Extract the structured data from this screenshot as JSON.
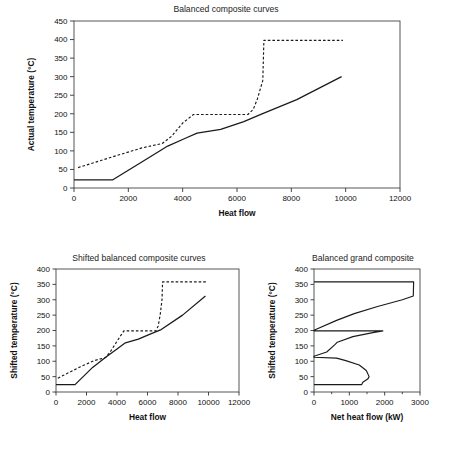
{
  "figure": {
    "name": "pinch-analysis-composite-curves-figure",
    "panels": [
      "balanced-composite-curves",
      "shifted-balanced-composite-curves",
      "balanced-grand-composite"
    ]
  },
  "colors": {
    "ink": "#1a1a1a",
    "frame": "#444444",
    "background": "#ffffff"
  },
  "chart_data": [
    {
      "id": "balanced-composite-curves",
      "type": "line",
      "title": "Balanced composite curves",
      "xlabel": "Heat flow",
      "ylabel": "Actual temperature (°C)",
      "xlim": [
        0,
        12000
      ],
      "ylim": [
        0,
        450
      ],
      "xticks": [
        0,
        2000,
        4000,
        6000,
        8000,
        10000,
        12000
      ],
      "xticklabels": [
        "0",
        "2000",
        "4000",
        "6000",
        "8000",
        "10000",
        "12000"
      ],
      "yticks": [
        0,
        50,
        100,
        150,
        200,
        250,
        300,
        350,
        400,
        450
      ],
      "yticklabels": [
        "0",
        "50",
        "100",
        "150",
        "200",
        "250",
        "300",
        "350",
        "400",
        "450"
      ],
      "grid": false,
      "legend": "none",
      "series": [
        {
          "name": "Cold composite curve",
          "style": "solid",
          "points": [
            [
              0,
              22
            ],
            [
              1430,
              22
            ],
            [
              2600,
              75
            ],
            [
              3450,
              113
            ],
            [
              4100,
              134
            ],
            [
              4530,
              148
            ],
            [
              5400,
              158
            ],
            [
              6250,
              179
            ],
            [
              6900,
              199
            ],
            [
              8200,
              238
            ],
            [
              9850,
              300
            ]
          ]
        },
        {
          "name": "Hot composite curve",
          "style": "dashed",
          "points": [
            [
              150,
              55
            ],
            [
              1600,
              88
            ],
            [
              2500,
              108
            ],
            [
              3250,
              120
            ],
            [
              3600,
              140
            ],
            [
              4000,
              175
            ],
            [
              4400,
              198
            ],
            [
              6400,
              198
            ],
            [
              6600,
              212
            ],
            [
              6750,
              240
            ],
            [
              6950,
              290
            ],
            [
              6990,
              398
            ],
            [
              9900,
              398
            ]
          ]
        }
      ]
    },
    {
      "id": "shifted-balanced-composite-curves",
      "type": "line",
      "title": "Shifted balanced composite curves",
      "xlabel": "Heat flow",
      "ylabel": "Shifted temperature (°C)",
      "xlim": [
        0,
        12000
      ],
      "ylim": [
        0,
        400
      ],
      "xticks": [
        0,
        2000,
        4000,
        6000,
        8000,
        10000,
        12000
      ],
      "xticklabels": [
        "0",
        "2000",
        "4000",
        "6000",
        "8000",
        "10000",
        "12000"
      ],
      "yticks": [
        0,
        50,
        100,
        150,
        200,
        250,
        300,
        350,
        400
      ],
      "yticklabels": [
        "0",
        "50",
        "100",
        "150",
        "200",
        "250",
        "300",
        "350",
        "400"
      ],
      "grid": false,
      "legend": "none",
      "series": [
        {
          "name": "Shifted cold composite curve",
          "style": "solid",
          "points": [
            [
              0,
              24
            ],
            [
              1250,
              24
            ],
            [
              2400,
              80
            ],
            [
              3300,
              115
            ],
            [
              4000,
              140
            ],
            [
              4550,
              160
            ],
            [
              5400,
              172
            ],
            [
              6250,
              190
            ],
            [
              6900,
              203
            ],
            [
              8300,
              250
            ],
            [
              9800,
              312
            ]
          ]
        },
        {
          "name": "Shifted hot composite curve",
          "style": "dashed",
          "points": [
            [
              120,
              45
            ],
            [
              1600,
              82
            ],
            [
              2500,
              102
            ],
            [
              3250,
              112
            ],
            [
              3550,
              130
            ],
            [
              4000,
              165
            ],
            [
              4450,
              199
            ],
            [
              6550,
              199
            ],
            [
              6700,
              215
            ],
            [
              6830,
              250
            ],
            [
              6950,
              300
            ],
            [
              6990,
              358
            ],
            [
              9900,
              358
            ]
          ]
        }
      ]
    },
    {
      "id": "balanced-grand-composite",
      "type": "line",
      "title": "Balanced grand composite",
      "xlabel": "Net heat flow (kW)",
      "ylabel": "Shifted temperature (°C)",
      "xlim": [
        0,
        3000
      ],
      "ylim": [
        0,
        400
      ],
      "xticks": [
        0,
        1000,
        2000,
        3000
      ],
      "xticklabels": [
        "0",
        "1000",
        "2000",
        "3000"
      ],
      "xminorticks": [
        500,
        1500,
        2500
      ],
      "yticks": [
        0,
        50,
        100,
        150,
        200,
        250,
        300,
        350,
        400
      ],
      "yticklabels": [
        "0",
        "50",
        "100",
        "150",
        "200",
        "250",
        "300",
        "350",
        "400"
      ],
      "grid": false,
      "legend": "none",
      "series": [
        {
          "name": "Balanced grand composite curve",
          "style": "solid",
          "points": [
            [
              0,
              24
            ],
            [
              1350,
              24
            ],
            [
              1380,
              32
            ],
            [
              1520,
              42
            ],
            [
              1560,
              50
            ],
            [
              1480,
              70
            ],
            [
              1280,
              88
            ],
            [
              900,
              102
            ],
            [
              640,
              110
            ],
            [
              0,
              113
            ],
            [
              0,
              116
            ],
            [
              360,
              130
            ],
            [
              600,
              155
            ],
            [
              660,
              162
            ],
            [
              1100,
              180
            ],
            [
              1700,
              194
            ],
            [
              1950,
              199
            ],
            [
              0,
              199
            ],
            [
              0,
              201
            ],
            [
              640,
              233
            ],
            [
              1140,
              255
            ],
            [
              1800,
              278
            ],
            [
              2500,
              300
            ],
            [
              2810,
              312
            ],
            [
              2820,
              358
            ],
            [
              0,
              358
            ]
          ]
        }
      ]
    }
  ]
}
